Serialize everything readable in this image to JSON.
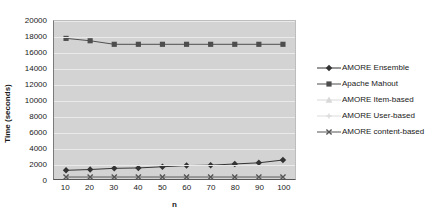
{
  "chart_data": {
    "type": "line",
    "title": "",
    "xlabel": "n",
    "ylabel": "Time (seconds)",
    "x": [
      10,
      20,
      30,
      40,
      50,
      60,
      70,
      80,
      90,
      100
    ],
    "xtick_labels": [
      "10",
      "20",
      "30",
      "40",
      "50",
      "60",
      "70",
      "80",
      "90",
      "100"
    ],
    "ytick_labels": [
      "0",
      "2000",
      "4000",
      "6000",
      "8000",
      "10000",
      "12000",
      "14000",
      "16000",
      "18000",
      "20000"
    ],
    "ytick_values": [
      0,
      2000,
      4000,
      6000,
      8000,
      10000,
      12000,
      14000,
      16000,
      18000,
      20000
    ],
    "xlim": [
      5,
      105
    ],
    "ylim": [
      0,
      20000
    ],
    "grid": true,
    "grid_axis": "y",
    "legend_position": "right",
    "plot_background": "#d3d3d3",
    "series": [
      {
        "name": "AMORE Ensemble",
        "marker": "diamond",
        "color": "#333333",
        "values": [
          1100,
          1200,
          1350,
          1400,
          1550,
          1700,
          1750,
          1900,
          2050,
          2400
        ]
      },
      {
        "name": "Apache Mahout",
        "marker": "square",
        "color": "#4d4d4d",
        "values": [
          17800,
          17500,
          17050,
          17050,
          17050,
          17050,
          17050,
          17050,
          17050,
          17050
        ]
      },
      {
        "name": "AMORE Item-based",
        "marker": "triangle",
        "color": "#d8d8d8",
        "values": [
          260,
          260,
          260,
          260,
          260,
          260,
          260,
          260,
          260,
          260
        ]
      },
      {
        "name": "AMORE User-based",
        "marker": "cross",
        "color": "#dcdcdc",
        "values": [
          250,
          250,
          250,
          250,
          250,
          250,
          250,
          250,
          250,
          250
        ]
      },
      {
        "name": "AMORE content-based",
        "marker": "x",
        "color": "#555555",
        "values": [
          250,
          250,
          250,
          250,
          250,
          250,
          250,
          250,
          250,
          250
        ]
      }
    ]
  }
}
